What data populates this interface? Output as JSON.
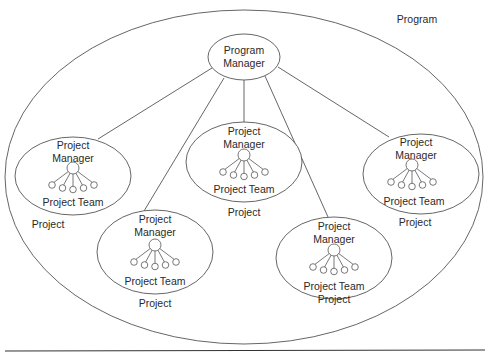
{
  "diagram": {
    "program_label": "Program",
    "program_manager": {
      "line1": "Program",
      "line2": "Manager"
    },
    "projects": [
      {
        "id": "project-left",
        "manager_line1": "Project",
        "manager_line2": "Manager",
        "team_label": "Project Team",
        "project_label": "Project",
        "cx": 73,
        "cy": 176,
        "rx": 58,
        "ry": 39
      },
      {
        "id": "project-center",
        "manager_line1": "Project",
        "manager_line2": "Manager",
        "team_label": "Project Team",
        "project_label": "Project",
        "cx": 244,
        "cy": 162,
        "rx": 58,
        "ry": 40
      },
      {
        "id": "project-bottom-left",
        "manager_line1": "Project",
        "manager_line2": "Manager",
        "team_label": "Project Team",
        "project_label": "Project",
        "cx": 155,
        "cy": 252,
        "rx": 58,
        "ry": 42
      },
      {
        "id": "project-bottom-right",
        "manager_line1": "Project",
        "manager_line2": "Manager",
        "team_label": "Project Team",
        "project_label": "Project",
        "cx": 334,
        "cy": 258,
        "rx": 58,
        "ry": 41
      },
      {
        "id": "project-right",
        "manager_line1": "Project",
        "manager_line2": "Manager",
        "team_label": "Project Team",
        "project_label": "Project",
        "cx": 421,
        "cy": 174,
        "rx": 58,
        "ry": 40
      }
    ],
    "colors": {
      "stroke": "#555555",
      "text": "#2a2a2a",
      "rule": "#333333"
    }
  }
}
